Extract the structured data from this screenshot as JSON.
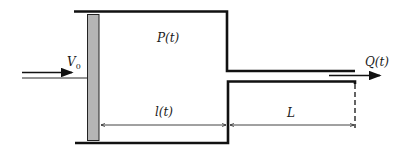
{
  "diagram": {
    "type": "piston-cylinder with outlet pipe",
    "labels": {
      "inlet_velocity": "V",
      "inlet_velocity_sub": "0",
      "pressure": "P(t)",
      "chamber_length": "l(t)",
      "pipe_length": "L",
      "outflow": "Q(t)"
    },
    "colors": {
      "line": "#111111",
      "piston_fill": "#b5b5b5",
      "background": "#ffffff"
    }
  }
}
